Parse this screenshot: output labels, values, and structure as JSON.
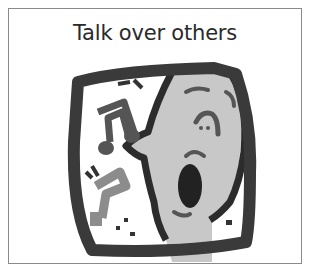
{
  "card": {
    "title": "Talk over others"
  },
  "illustration": {
    "icon": "singing-face-with-music-notes-icon",
    "colors": {
      "frame": "#3a3a3a",
      "face": "#c8c8c8",
      "note_dark": "#555555",
      "note_light": "#8c8c8c",
      "mouth": "#222222"
    }
  }
}
